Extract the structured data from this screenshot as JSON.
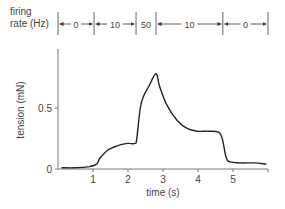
{
  "chart_data": {
    "type": "line",
    "title": "",
    "xlabel": "time (s)",
    "ylabel": "tension (mN)",
    "xlim": [
      0,
      6
    ],
    "ylim": [
      0,
      0.8
    ],
    "xticks": [
      1,
      2,
      3,
      4,
      5
    ],
    "xtick_labels": [
      "1",
      "2",
      "3",
      "4",
      "5"
    ],
    "yticks": [
      0,
      0.5
    ],
    "ytick_labels": [
      "0",
      "0.5"
    ],
    "grid": false,
    "legend": null,
    "series": [
      {
        "name": "tension",
        "x": [
          0.1,
          0.5,
          0.9,
          1.1,
          1.2,
          1.4,
          1.6,
          1.8,
          2.0,
          2.2,
          2.25,
          2.35,
          2.45,
          2.6,
          2.8,
          2.9,
          3.1,
          3.4,
          3.7,
          4.0,
          4.3,
          4.6,
          4.7,
          4.8,
          4.9,
          5.2,
          5.6,
          5.95
        ],
        "y": [
          0.01,
          0.01,
          0.02,
          0.04,
          0.09,
          0.15,
          0.18,
          0.2,
          0.21,
          0.21,
          0.25,
          0.5,
          0.6,
          0.68,
          0.78,
          0.68,
          0.53,
          0.4,
          0.33,
          0.31,
          0.31,
          0.3,
          0.24,
          0.1,
          0.06,
          0.05,
          0.05,
          0.04
        ]
      }
    ],
    "stimulus": {
      "label": "firing rate (Hz)",
      "segments": [
        {
          "label": "0",
          "start": 0,
          "end": 1.03
        },
        {
          "label": "10",
          "start": 1.03,
          "end": 2.23
        },
        {
          "label": "50",
          "start": 2.23,
          "end": 2.8
        },
        {
          "label": "10",
          "start": 2.8,
          "end": 4.71
        },
        {
          "label": "0",
          "start": 4.71,
          "end": 6.0
        }
      ]
    }
  },
  "labels": {
    "firing_line1": "firing",
    "firing_line2": "rate (Hz)",
    "ylabel": "tension (mN)",
    "xlabel": "time (s)"
  }
}
